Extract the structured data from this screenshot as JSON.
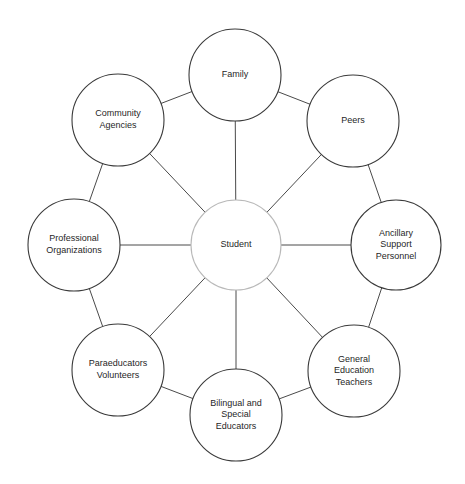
{
  "diagram": {
    "type": "radial-web-diagram",
    "center": {
      "id": "student",
      "label": "Student",
      "lines": [
        "Student"
      ],
      "cx": 236,
      "cy": 245,
      "r": 45,
      "stroke": "#b9b9b9"
    },
    "nodes": [
      {
        "id": "family",
        "label": "Family",
        "lines": [
          "Family"
        ],
        "cx": 235,
        "cy": 75,
        "r": 46,
        "angle": -90
      },
      {
        "id": "peers",
        "label": "Peers",
        "lines": [
          "Peers"
        ],
        "cx": 353,
        "cy": 121,
        "r": 46,
        "angle": -45
      },
      {
        "id": "ancillary-support-personnel",
        "label": "Ancillary Support Personnel",
        "lines": [
          "Ancillary",
          "Support",
          "Personnel"
        ],
        "cx": 396,
        "cy": 245,
        "r": 45,
        "angle": 0
      },
      {
        "id": "general-education-teachers",
        "label": "General Education Teachers",
        "lines": [
          "General",
          "Education",
          "Teachers"
        ],
        "cx": 354,
        "cy": 371,
        "r": 46,
        "angle": 45
      },
      {
        "id": "bilingual-and-special-educators",
        "label": "Bilingual and Special Educators",
        "lines": [
          "Bilingual and",
          "Special",
          "Educators"
        ],
        "cx": 236,
        "cy": 415,
        "r": 46,
        "angle": 90
      },
      {
        "id": "paraeducators-volunteers",
        "label": "Paraeducators Volunteers",
        "lines": [
          "Paraeducators",
          "Volunteers"
        ],
        "cx": 118,
        "cy": 370,
        "r": 46,
        "angle": 135
      },
      {
        "id": "professional-organizations",
        "label": "Professional Organizations",
        "lines": [
          "Professional",
          "Organizations"
        ],
        "cx": 74,
        "cy": 245,
        "r": 46,
        "angle": 180
      },
      {
        "id": "community-agencies",
        "label": "Community Agencies",
        "lines": [
          "Community",
          "Agencies"
        ],
        "cx": 118,
        "cy": 120,
        "r": 46,
        "angle": -135
      }
    ],
    "spoke_links": [
      [
        "student",
        "family"
      ],
      [
        "student",
        "peers"
      ],
      [
        "student",
        "ancillary-support-personnel"
      ],
      [
        "student",
        "general-education-teachers"
      ],
      [
        "student",
        "bilingual-and-special-educators"
      ],
      [
        "student",
        "paraeducators-volunteers"
      ],
      [
        "student",
        "professional-organizations"
      ],
      [
        "student",
        "community-agencies"
      ]
    ],
    "ring_links": [
      [
        "community-agencies",
        "family"
      ],
      [
        "family",
        "peers"
      ],
      [
        "peers",
        "ancillary-support-personnel"
      ],
      [
        "ancillary-support-personnel",
        "general-education-teachers"
      ],
      [
        "general-education-teachers",
        "bilingual-and-special-educators"
      ],
      [
        "bilingual-and-special-educators",
        "paraeducators-volunteers"
      ],
      [
        "paraeducators-volunteers",
        "professional-organizations"
      ],
      [
        "professional-organizations",
        "community-agencies"
      ]
    ],
    "colors": {
      "background": "#ffffff",
      "node_stroke": "#3a3a3a",
      "center_stroke": "#b9b9b9",
      "link_stroke": "#4a4a4a",
      "text": "#1f1f1f"
    }
  }
}
